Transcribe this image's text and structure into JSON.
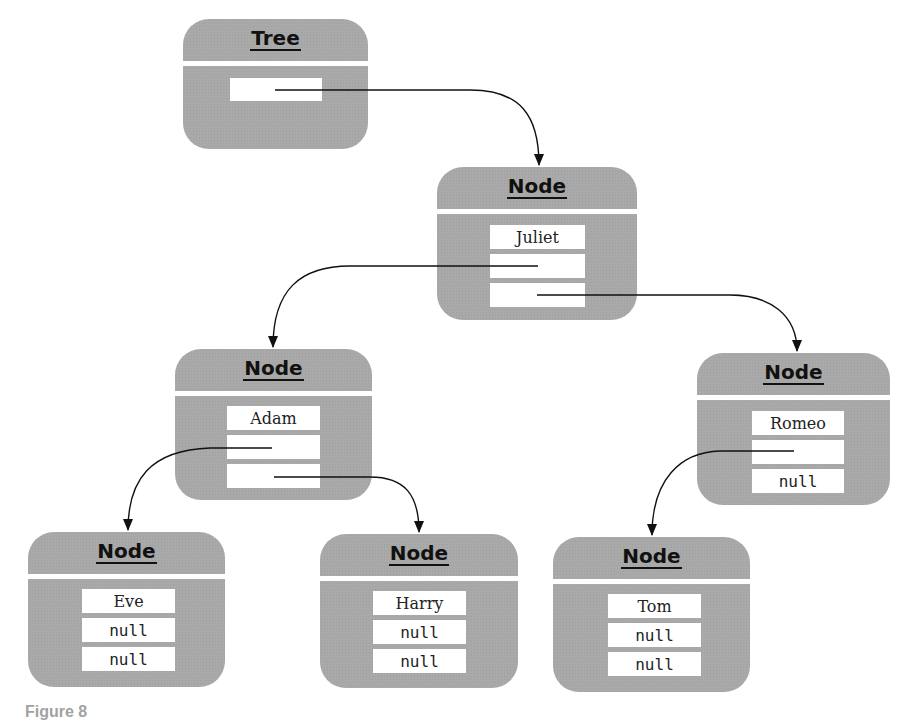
{
  "diagram": {
    "type": "binary-tree-object-diagram",
    "tree": {
      "title": "Tree",
      "fields": [
        ""
      ]
    },
    "nodes": {
      "juliet": {
        "title": "Node",
        "data": "Juliet",
        "left": "",
        "right": ""
      },
      "adam": {
        "title": "Node",
        "data": "Adam",
        "left": "",
        "right": ""
      },
      "romeo": {
        "title": "Node",
        "data": "Romeo",
        "left": "",
        "right": "null"
      },
      "eve": {
        "title": "Node",
        "data": "Eve",
        "left": "null",
        "right": "null"
      },
      "harry": {
        "title": "Node",
        "data": "Harry",
        "left": "null",
        "right": "null"
      },
      "tom": {
        "title": "Node",
        "data": "Tom",
        "left": "null",
        "right": "null"
      }
    },
    "edges": [
      {
        "from": "tree.root",
        "to": "juliet"
      },
      {
        "from": "juliet.left",
        "to": "adam"
      },
      {
        "from": "juliet.right",
        "to": "romeo"
      },
      {
        "from": "adam.left",
        "to": "eve"
      },
      {
        "from": "adam.right",
        "to": "harry"
      },
      {
        "from": "romeo.left",
        "to": "tom"
      }
    ],
    "colors": {
      "box_fill": "#a9a9a9",
      "field_fill": "#ffffff",
      "line": "#111111"
    }
  },
  "caption": {
    "text": "Figure 8"
  }
}
